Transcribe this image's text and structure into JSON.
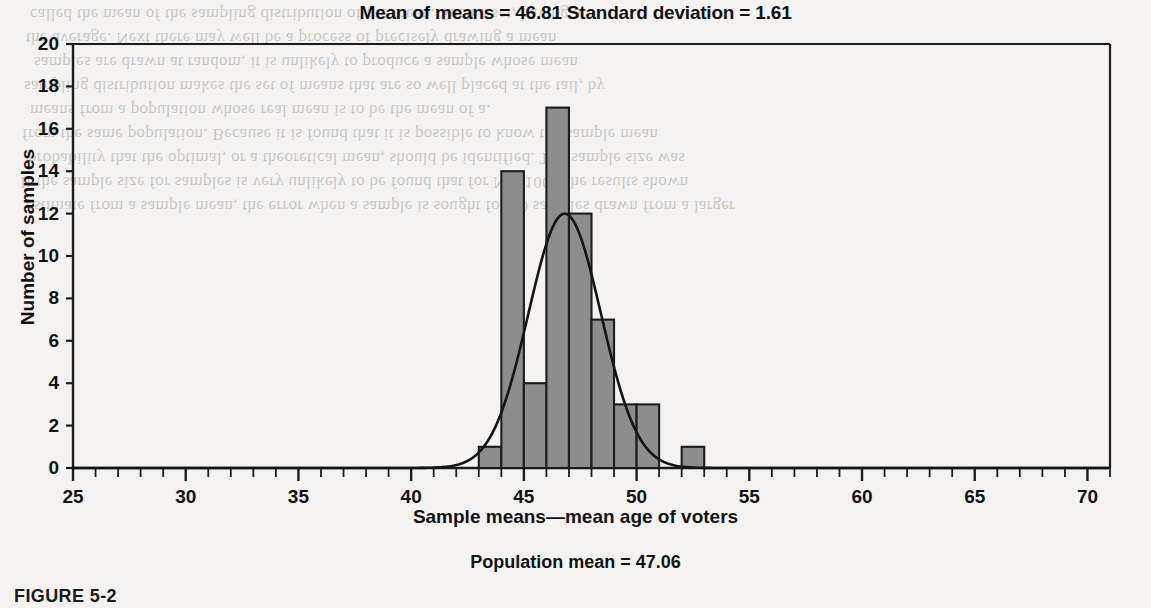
{
  "figure": {
    "title": "Mean of means = 46.81 Standard deviation = 1.61",
    "caption": "FIGURE 5-2",
    "footnote": "Population mean = 47.06"
  },
  "chart_data": {
    "type": "bar",
    "title": "Mean of means = 46.81 Standard deviation = 1.61",
    "xlabel": "Sample means—mean age of voters",
    "ylabel": "Number of samples",
    "xlim": [
      25,
      71
    ],
    "ylim": [
      0,
      20
    ],
    "grid": false,
    "legend": "none",
    "x_major_ticks": [
      25,
      30,
      35,
      40,
      45,
      50,
      55,
      60,
      65,
      70
    ],
    "x_minor_tick_step": 1,
    "y_ticks": [
      0,
      2,
      4,
      6,
      8,
      10,
      12,
      14,
      16,
      18,
      20
    ],
    "bin_width": 1,
    "bins": [
      {
        "start": 43,
        "end": 44,
        "value": 1
      },
      {
        "start": 44,
        "end": 45,
        "value": 14
      },
      {
        "start": 45,
        "end": 46,
        "value": 4
      },
      {
        "start": 46,
        "end": 47,
        "value": 17
      },
      {
        "start": 47,
        "end": 48,
        "value": 12
      },
      {
        "start": 48,
        "end": 49,
        "value": 7
      },
      {
        "start": 49,
        "end": 50,
        "value": 3
      },
      {
        "start": 50,
        "end": 51,
        "value": 3
      },
      {
        "start": 52,
        "end": 53,
        "value": 1
      }
    ],
    "overlay_curve": {
      "name": "normal-curve",
      "mean": 46.81,
      "std_dev": 1.61,
      "peak_value": 12.0
    },
    "annotations": {
      "mean_of_means": 46.81,
      "standard_deviation": 1.61,
      "population_mean": 47.06
    },
    "colors": {
      "bar_fill": "#8d8d8d",
      "bar_stroke": "#1c1c1c",
      "curve": "#141414",
      "axis": "#1c1c1c",
      "background": "#f4f3f1"
    }
  },
  "background_text": {
    "lines": [
      "called the mean of the sampling distribution of the mean. Such a set, having a",
      "the average. Next there may well be  a process of precisely drawing a mean",
      "samples are drawn at random, it is unlikely to produce a sample whose mean",
      "sampling distribution makes the set of means that are so well placed at the tail, by",
      "means from a population whose real mean is to be the mean of a.",
      "from the same population. Because it is found that it is possible to know the sample mean",
      "probability that the optimal, or a theoretical mean, should be identified. The sample size was",
      "If the sample size for samples is very unlikely to be found that for N = 100. The results shown",
      "estimate from a sample mean, the error when a sample is sought for 30 samples drawn from a larger"
    ]
  }
}
